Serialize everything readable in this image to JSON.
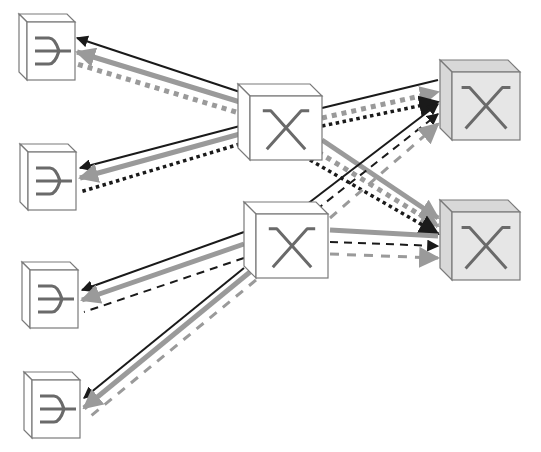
{
  "diagram": {
    "width": 541,
    "height": 452,
    "colors": {
      "background": "#ffffff",
      "cube_outline": "#7a7a7a",
      "cube_face_light": "#ffffff",
      "cube_face_shaded": "#e6e6e6",
      "cube_side_shaded": "#d8d8d8",
      "glyph": "#6a6a6a",
      "line_black": "#1a1a1a",
      "line_gray": "#9a9a9a"
    },
    "nodes": [
      {
        "id": "leaf-1",
        "type": "endpoint",
        "icon": "fork-icon",
        "x": 27,
        "y": 22,
        "w": 48,
        "h": 58,
        "d": 8,
        "shaded": false
      },
      {
        "id": "leaf-2",
        "type": "endpoint",
        "icon": "fork-icon",
        "x": 28,
        "y": 152,
        "w": 48,
        "h": 58,
        "d": 8,
        "shaded": false
      },
      {
        "id": "leaf-3",
        "type": "endpoint",
        "icon": "fork-icon",
        "x": 30,
        "y": 270,
        "w": 48,
        "h": 58,
        "d": 8,
        "shaded": false
      },
      {
        "id": "leaf-4",
        "type": "endpoint",
        "icon": "fork-icon",
        "x": 32,
        "y": 380,
        "w": 48,
        "h": 58,
        "d": 8,
        "shaded": false
      },
      {
        "id": "switch-mid-top",
        "type": "switch",
        "icon": "cross-icon",
        "x": 250,
        "y": 96,
        "w": 72,
        "h": 64,
        "d": 12,
        "shaded": false
      },
      {
        "id": "switch-mid-bottom",
        "type": "switch",
        "icon": "cross-icon",
        "x": 256,
        "y": 214,
        "w": 72,
        "h": 64,
        "d": 12,
        "shaded": false
      },
      {
        "id": "switch-right-top",
        "type": "switch",
        "icon": "cross-icon",
        "x": 452,
        "y": 72,
        "w": 68,
        "h": 68,
        "d": 12,
        "shaded": true
      },
      {
        "id": "switch-right-bottom",
        "type": "switch",
        "icon": "cross-icon",
        "x": 452,
        "y": 212,
        "w": 68,
        "h": 68,
        "d": 12,
        "shaded": true
      }
    ],
    "links": [
      {
        "from": [
          240,
          92
        ],
        "to": [
          77,
          38
        ],
        "style": "black-solid",
        "arrow": true
      },
      {
        "from": [
          240,
          102
        ],
        "to": [
          77,
          52
        ],
        "style": "gray-thick",
        "arrow": true
      },
      {
        "from": [
          236,
          112
        ],
        "to": [
          77,
          64
        ],
        "style": "gray-squares",
        "arrow": false
      },
      {
        "from": [
          240,
          126
        ],
        "to": [
          80,
          168
        ],
        "style": "black-solid",
        "arrow": true
      },
      {
        "from": [
          240,
          134
        ],
        "to": [
          80,
          178
        ],
        "style": "gray-thick",
        "arrow": true
      },
      {
        "from": [
          240,
          144
        ],
        "to": [
          80,
          192
        ],
        "style": "black-dots",
        "arrow": false
      },
      {
        "from": [
          322,
          108
        ],
        "to": [
          438,
          80
        ],
        "style": "black-solid",
        "arrow": false
      },
      {
        "from": [
          322,
          118
        ],
        "to": [
          438,
          92
        ],
        "style": "gray-squares",
        "arrow": true
      },
      {
        "from": [
          322,
          126
        ],
        "to": [
          438,
          102
        ],
        "style": "black-dots",
        "arrow": true
      },
      {
        "from": [
          322,
          140
        ],
        "to": [
          438,
          218
        ],
        "style": "gray-thick",
        "arrow": true
      },
      {
        "from": [
          318,
          152
        ],
        "to": [
          438,
          226
        ],
        "style": "gray-squares",
        "arrow": true
      },
      {
        "from": [
          310,
          160
        ],
        "to": [
          438,
          234
        ],
        "style": "black-dots",
        "arrow": true
      },
      {
        "from": [
          306,
          205
        ],
        "to": [
          438,
          104
        ],
        "style": "black-solid",
        "arrow": true
      },
      {
        "from": [
          316,
          210
        ],
        "to": [
          438,
          114
        ],
        "style": "black-dashed",
        "arrow": true
      },
      {
        "from": [
          330,
          218
        ],
        "to": [
          438,
          124
        ],
        "style": "gray-dashed",
        "arrow": true
      },
      {
        "from": [
          330,
          230
        ],
        "to": [
          438,
          236
        ],
        "style": "gray-thick",
        "arrow": false
      },
      {
        "from": [
          330,
          242
        ],
        "to": [
          438,
          246
        ],
        "style": "black-dashed",
        "arrow": true
      },
      {
        "from": [
          330,
          254
        ],
        "to": [
          438,
          258
        ],
        "style": "gray-dashed",
        "arrow": true
      },
      {
        "from": [
          244,
          232
        ],
        "to": [
          82,
          290
        ],
        "style": "black-solid",
        "arrow": true
      },
      {
        "from": [
          244,
          244
        ],
        "to": [
          82,
          300
        ],
        "style": "gray-thick",
        "arrow": true
      },
      {
        "from": [
          244,
          258
        ],
        "to": [
          84,
          312
        ],
        "style": "black-dashed",
        "arrow": false
      },
      {
        "from": [
          244,
          268
        ],
        "to": [
          84,
          398
        ],
        "style": "black-solid",
        "arrow": true
      },
      {
        "from": [
          250,
          272
        ],
        "to": [
          84,
          408
        ],
        "style": "gray-thick",
        "arrow": true
      },
      {
        "from": [
          256,
          280
        ],
        "to": [
          86,
          420
        ],
        "style": "gray-dashed",
        "arrow": false
      }
    ]
  }
}
